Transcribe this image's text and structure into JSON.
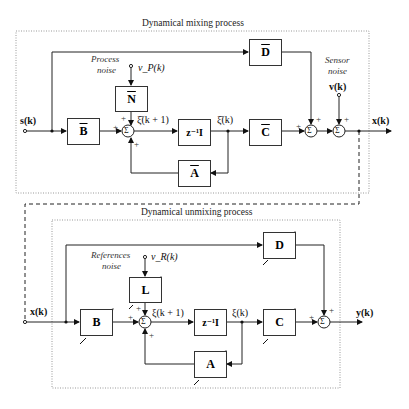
{
  "mixing": {
    "title": "Dynamical mixing process",
    "input": "s(k)",
    "output": "x(k)",
    "process_noise_label_1": "Process",
    "process_noise_label_2": "noise",
    "process_noise_signal": "v_P(k)",
    "sensor_noise_label_1": "Sensor",
    "sensor_noise_label_2": "noise",
    "sensor_noise_signal": "v(k)",
    "state_next": "ξ̄(k + 1)",
    "state": "ξ̄(k)",
    "blocks": {
      "B": "B",
      "N": "N",
      "delay": "z⁻¹I",
      "C": "C",
      "D": "D",
      "A": "A"
    }
  },
  "unmixing": {
    "title": "Dynamical unmixing process",
    "input": "x(k)",
    "output": "y(k)",
    "ref_noise_label_1": "References",
    "ref_noise_label_2": "noise",
    "ref_noise_signal": "v_R(k)",
    "state_next": "ξ(k + 1)",
    "state": "ξ(k)",
    "blocks": {
      "B": "B",
      "L": "L",
      "delay": "z⁻¹I",
      "C": "C",
      "D": "D",
      "A": "A"
    }
  },
  "signs": {
    "plus": "+",
    "sum": "Σ"
  }
}
